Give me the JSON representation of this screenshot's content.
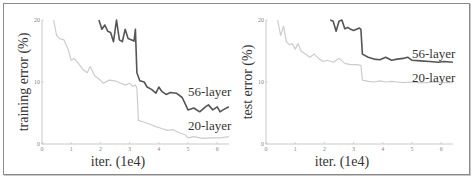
{
  "chart_data": [
    {
      "type": "line",
      "title": "",
      "xlabel": "iter. (1e4)",
      "ylabel": "training error (%)",
      "xlim": [
        0,
        6.4
      ],
      "ylim": [
        0,
        20
      ],
      "xticks": [
        "0",
        "1",
        "2",
        "3",
        "4",
        "5",
        "6"
      ],
      "yticks": [
        "0",
        "10",
        "20"
      ],
      "grid": false,
      "series": [
        {
          "name": "56-layer",
          "color": "#555555",
          "x": [
            1.95,
            2.05,
            2.15,
            2.25,
            2.35,
            2.45,
            2.55,
            2.65,
            2.75,
            2.85,
            2.95,
            3.05,
            3.15,
            3.2,
            3.25,
            3.35,
            3.5,
            3.6,
            3.75,
            3.9,
            4.0,
            4.1,
            4.25,
            4.4,
            4.6,
            4.8,
            4.9,
            5.0,
            5.2,
            5.4,
            5.6,
            5.7,
            5.85,
            6.0,
            6.1,
            6.2,
            6.4
          ],
          "y": [
            20,
            18.5,
            19.2,
            18.2,
            18.0,
            16.5,
            20.0,
            16.8,
            16.5,
            18.5,
            17.0,
            16.8,
            16.6,
            18.5,
            11.5,
            10.2,
            10.0,
            9.2,
            8.8,
            8.2,
            9.2,
            8.5,
            8.0,
            8.3,
            8.2,
            7.5,
            6.5,
            5.5,
            5.8,
            5.2,
            6.0,
            6.3,
            5.5,
            6.0,
            5.2,
            5.5,
            6.0
          ]
        },
        {
          "name": "20-layer",
          "color": "#cccccc",
          "x": [
            0.4,
            0.5,
            0.6,
            0.75,
            0.9,
            1.0,
            1.1,
            1.25,
            1.4,
            1.55,
            1.65,
            1.8,
            1.95,
            2.1,
            2.3,
            2.5,
            2.7,
            2.85,
            3.0,
            3.1,
            3.2,
            3.25,
            3.3,
            3.5,
            3.7,
            3.9,
            4.1,
            4.3,
            4.5,
            4.7,
            4.9,
            5.0,
            5.2,
            5.5,
            5.8,
            6.1,
            6.4
          ],
          "y": [
            20,
            17.5,
            17.0,
            16.8,
            15.2,
            13.5,
            13.8,
            13.0,
            12.0,
            11.5,
            12.5,
            11.0,
            10.5,
            9.8,
            10.3,
            10.2,
            9.8,
            9.5,
            9.8,
            9.3,
            9.5,
            9.0,
            3.8,
            3.5,
            3.2,
            2.8,
            2.5,
            2.2,
            2.3,
            1.8,
            1.5,
            1.0,
            1.2,
            0.9,
            1.0,
            1.0,
            1.2
          ]
        }
      ]
    },
    {
      "type": "line",
      "title": "",
      "xlabel": "iter. (1e4)",
      "ylabel": "test error (%)",
      "xlim": [
        0,
        6.4
      ],
      "ylim": [
        0,
        20
      ],
      "xticks": [
        "0",
        "1",
        "2",
        "3",
        "4",
        "5",
        "6"
      ],
      "yticks": [
        "0",
        "10",
        "20"
      ],
      "grid": false,
      "series": [
        {
          "name": "56-layer",
          "color": "#555555",
          "x": [
            2.2,
            2.3,
            2.4,
            2.5,
            2.6,
            2.7,
            2.8,
            2.9,
            3.0,
            3.1,
            3.2,
            3.25,
            3.3,
            3.5,
            3.7,
            3.9,
            4.1,
            4.3,
            4.5,
            4.7,
            4.85,
            5.0,
            5.3,
            5.6,
            5.9,
            6.1,
            6.4
          ],
          "y": [
            20,
            19.8,
            18.2,
            19.8,
            20.0,
            18.6,
            18.8,
            18.5,
            18.3,
            18.5,
            18.7,
            18.5,
            14.5,
            14.0,
            13.7,
            13.6,
            14.0,
            13.5,
            13.7,
            13.8,
            14.0,
            13.5,
            13.4,
            13.3,
            13.2,
            13.3,
            13.2
          ]
        },
        {
          "name": "20-layer",
          "color": "#cccccc",
          "x": [
            0.4,
            0.5,
            0.6,
            0.7,
            0.8,
            0.9,
            1.0,
            1.1,
            1.2,
            1.35,
            1.5,
            1.65,
            1.8,
            1.95,
            2.1,
            2.3,
            2.5,
            2.7,
            2.9,
            3.1,
            3.25,
            3.3,
            3.5,
            3.7,
            3.9,
            4.1,
            4.3,
            4.5,
            4.7,
            4.9,
            5.2,
            5.5,
            5.8,
            6.1,
            6.4
          ],
          "y": [
            20,
            17.5,
            19.0,
            16.5,
            16.0,
            16.2,
            15.3,
            16.2,
            15.0,
            14.5,
            14.0,
            14.5,
            13.8,
            13.3,
            13.5,
            13.2,
            13.8,
            13.0,
            12.8,
            12.8,
            12.7,
            10.3,
            10.1,
            10.0,
            10.2,
            10.0,
            10.1,
            10.0,
            9.9,
            10.0,
            9.9,
            9.9,
            10.0,
            9.9,
            9.9
          ]
        }
      ]
    }
  ]
}
